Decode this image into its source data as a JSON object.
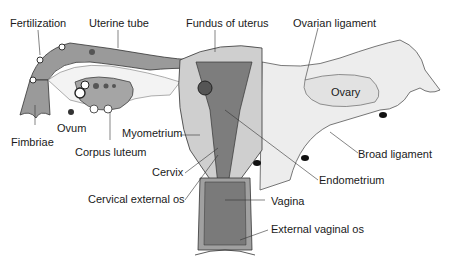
{
  "diagram": {
    "type": "anatomical illustration",
    "labels": {
      "fertilization": "Fertilization",
      "uterine_tube": "Uterine tube",
      "fundus": "Fundus of uterus",
      "ovarian_ligament": "Ovarian ligament",
      "ovary": "Ovary",
      "ovum": "Ovum",
      "fimbriae": "Fimbriae",
      "corpus_luteum": "Corpus luteum",
      "myometrium": "Myometrium",
      "broad_ligament": "Broad ligament",
      "endometrium": "Endometrium",
      "cervix": "Cervix",
      "cervical_external_os": "Cervical external os",
      "vagina": "Vagina",
      "external_vaginal_os": "External vaginal os"
    },
    "colors": {
      "line": "#333333",
      "tissue_dark": "#7a7a7a",
      "tissue_mid": "#a8a8a8",
      "tissue_light": "#cfcfcf",
      "ligament": "#ececec"
    }
  }
}
